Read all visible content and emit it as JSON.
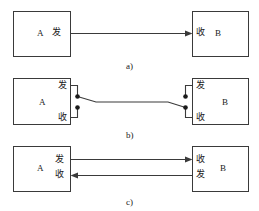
{
  "figure": {
    "background_color": "#ffffff",
    "line_color": "#3a3a3a",
    "text_color": "#1a1a1a"
  },
  "terms": {
    "send": "发",
    "receive": "收",
    "device_a": "A",
    "device_b": "B"
  },
  "panels": [
    {
      "id": "panel-a",
      "caption": "a)",
      "left_box": {
        "device": "A",
        "port_inline": "发"
      },
      "right_box": {
        "device": "B",
        "port_inline": "收"
      }
    },
    {
      "id": "panel-b",
      "caption": "b)",
      "left_box": {
        "device": "A",
        "port_top": "发",
        "port_bottom": "收"
      },
      "right_box": {
        "device": "B",
        "port_top": "发",
        "port_bottom": "收"
      }
    },
    {
      "id": "panel-c",
      "caption": "c)",
      "left_box": {
        "device": "A",
        "port_top": "发",
        "port_bottom": "收"
      },
      "right_box": {
        "device": "B",
        "port_top": "收",
        "port_bottom": "发"
      }
    }
  ]
}
